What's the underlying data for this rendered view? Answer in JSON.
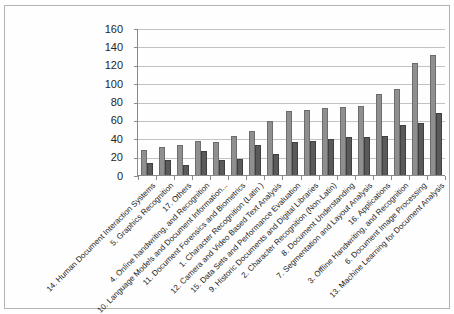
{
  "figure": {
    "background": "#ffffff",
    "frame_border_color": "#b3b3b3",
    "gridline_color": "#c2c2c2",
    "axis_color": "#8a8a8a"
  },
  "chart_data": {
    "type": "bar",
    "title": "",
    "legend": "none",
    "grid": "horizontal",
    "ylim": [
      0,
      160
    ],
    "ytick_step": 20,
    "ytick_labels": [
      "0",
      "20",
      "40",
      "60",
      "80",
      "100",
      "120",
      "140",
      "160"
    ],
    "categories": [
      "14. Human Document Interaction Systems",
      "5. Graphics Recognition",
      "17. Others",
      "4. Online handwriting, and Recognition",
      "10. Language Models and Document Information...",
      "11. Document Forensics and Biometrics",
      "1. Character Recognition (Latin )",
      "12. Camera and Video Based Text Analysis",
      "15. Data Sets and Performance Evaluation",
      "9. Historic Documents and Digital Libraries",
      "2. Character Recognition (Non-Latin)",
      "8. Document Understanding",
      "7. Segmentation and Layout Analysis",
      "16. Applications",
      "3. Offline Handwriting, and Recognition",
      "6. Document Image Processing",
      "13. Machine Learning for Document Analysis"
    ],
    "series": [
      {
        "name": "",
        "color": "#8f8f8f",
        "border_color": "#6d6d6d",
        "values": [
          28,
          32,
          34,
          38,
          37,
          43,
          49,
          60,
          71,
          72,
          74,
          75,
          76,
          89,
          95,
          123,
          132
        ]
      },
      {
        "name": "",
        "color": "#5a5a5a",
        "border_color": "#404040",
        "values": [
          14,
          17,
          12,
          27,
          17,
          18,
          34,
          24,
          37,
          38,
          40,
          42,
          42,
          43,
          56,
          58,
          69
        ]
      }
    ]
  }
}
